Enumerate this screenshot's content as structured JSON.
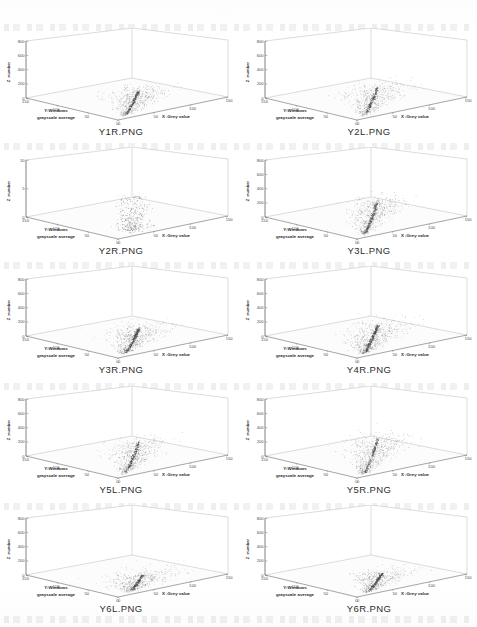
{
  "page": {
    "background_color": "#ffffff",
    "layout": "2 columns x 5 rows grid of 3D scatter plots",
    "columns": 2,
    "rows": 5
  },
  "axis_labels": {
    "x": "X :Grey value",
    "y_line1": "Y:Windows",
    "y_line2": "grayscale average",
    "z": "Z :number"
  },
  "chart_data": [
    {
      "type": "scatter",
      "title": "Y1R.PNG",
      "xlabel": "X :Grey value",
      "ylabel": "Y:Windows grayscale average",
      "zlabel": "Z :number",
      "xlim": [
        0,
        150
      ],
      "ylim": [
        0,
        150
      ],
      "zlim": [
        0,
        800
      ],
      "xticks": [
        0,
        50,
        100,
        150
      ],
      "yticks": [
        0,
        50,
        100,
        150
      ],
      "zticks": [
        0,
        200,
        400,
        600,
        800
      ],
      "grid": false,
      "point_color": "#555555",
      "cluster": "dense fan-shaped plume rising from origin toward mid grey values",
      "points_approx": 1800
    },
    {
      "type": "scatter",
      "title": "Y2L.PNG",
      "xlabel": "X :Grey value",
      "ylabel": "Y:Windows grayscale average",
      "zlabel": "Z :number",
      "xlim": [
        0,
        150
      ],
      "ylim": [
        0,
        150
      ],
      "zlim": [
        0,
        800
      ],
      "xticks": [
        0,
        50,
        100,
        150
      ],
      "yticks": [
        0,
        50,
        100,
        150
      ],
      "zticks": [
        0,
        200,
        400,
        600,
        800
      ],
      "grid": false,
      "point_color": "#555555",
      "cluster": "narrow vertical spine with broad fan spreading right",
      "points_approx": 1700
    },
    {
      "type": "scatter",
      "title": "Y2R.PNG",
      "xlabel": "X :Grey value",
      "ylabel": "Y:Windows grayscale average",
      "zlabel": "Z :number",
      "xlim": [
        0,
        150
      ],
      "ylim": [
        0,
        150
      ],
      "zlim": [
        0,
        10
      ],
      "xticks": [
        0,
        50,
        100,
        150
      ],
      "yticks": [
        0,
        50,
        100,
        150
      ],
      "zticks": [
        0,
        5,
        10
      ],
      "grid": false,
      "point_color": "#6a6a6a",
      "cluster": "diffuse low-amplitude speckle cloud near the floor",
      "points_approx": 900
    },
    {
      "type": "scatter",
      "title": "Y3L.PNG",
      "xlabel": "X :Grey value",
      "ylabel": "Y:Windows grayscale average",
      "zlabel": "Z :number",
      "xlim": [
        0,
        150
      ],
      "ylim": [
        0,
        150
      ],
      "zlim": [
        0,
        800
      ],
      "xticks": [
        0,
        50,
        100,
        150
      ],
      "yticks": [
        0,
        50,
        100,
        150
      ],
      "zticks": [
        0,
        200,
        400,
        600,
        800
      ],
      "grid": false,
      "point_color": "#555555",
      "cluster": "dense wedge of points fanning up and to the right",
      "points_approx": 1900
    },
    {
      "type": "scatter",
      "title": "Y3R.PNG",
      "xlabel": "X :Grey value",
      "ylabel": "Y:Windows grayscale average",
      "zlabel": "Z :number",
      "xlim": [
        0,
        150
      ],
      "ylim": [
        0,
        150
      ],
      "zlim": [
        0,
        800
      ],
      "xticks": [
        0,
        50,
        100,
        150
      ],
      "yticks": [
        0,
        50,
        100,
        150
      ],
      "zticks": [
        0,
        200,
        400,
        600,
        800
      ],
      "grid": false,
      "point_color": "#555555",
      "cluster": "wide plume leaning right with long tail",
      "points_approx": 2000
    },
    {
      "type": "scatter",
      "title": "Y4R.PNG",
      "xlabel": "X :Grey value",
      "ylabel": "Y:Windows grayscale average",
      "zlabel": "Z :number",
      "xlim": [
        0,
        150
      ],
      "ylim": [
        0,
        150
      ],
      "zlim": [
        0,
        800
      ],
      "xticks": [
        0,
        50,
        100,
        150
      ],
      "yticks": [
        0,
        50,
        100,
        150
      ],
      "zticks": [
        0,
        200,
        400,
        600,
        800
      ],
      "grid": false,
      "point_color": "#555555",
      "cluster": "compact dense plume with steep dark spine",
      "points_approx": 2100
    },
    {
      "type": "scatter",
      "title": "Y5L.PNG",
      "xlabel": "X :Grey value",
      "ylabel": "Y:Windows grayscale average",
      "zlabel": "Z :number",
      "xlim": [
        0,
        150
      ],
      "ylim": [
        0,
        150
      ],
      "zlim": [
        0,
        800
      ],
      "xticks": [
        0,
        50,
        100,
        150
      ],
      "yticks": [
        0,
        50,
        100,
        150
      ],
      "zticks": [
        0,
        200,
        400,
        600,
        800
      ],
      "grid": false,
      "point_color": "#555555",
      "cluster": "tall narrow spike with scattered base cloud",
      "points_approx": 1800
    },
    {
      "type": "scatter",
      "title": "Y5R.PNG",
      "xlabel": "X :Grey value",
      "ylabel": "Y:Windows grayscale average",
      "zlabel": "Z :number",
      "xlim": [
        0,
        150
      ],
      "ylim": [
        0,
        150
      ],
      "zlim": [
        0,
        800
      ],
      "xticks": [
        0,
        50,
        100,
        150
      ],
      "yticks": [
        0,
        50,
        100,
        150
      ],
      "zticks": [
        0,
        200,
        400,
        600,
        800
      ],
      "grid": false,
      "point_color": "#555555",
      "cluster": "steep spine with fan spreading up-right",
      "points_approx": 1900
    },
    {
      "type": "scatter",
      "title": "Y6L.PNG",
      "xlabel": "X :Grey value",
      "ylabel": "Y:Windows grayscale average",
      "zlabel": "Z :number",
      "xlim": [
        0,
        150
      ],
      "ylim": [
        0,
        150
      ],
      "zlim": [
        0,
        800
      ],
      "xticks": [
        0,
        50,
        100,
        150
      ],
      "yticks": [
        0,
        50,
        100,
        150
      ],
      "zticks": [
        0,
        200,
        400,
        600,
        800
      ],
      "grid": false,
      "point_color": "#555555",
      "cluster": "broad low flat cloud hugging the floor with a light ridge",
      "points_approx": 1600
    },
    {
      "type": "scatter",
      "title": "Y6R.PNG",
      "xlabel": "X :Grey value",
      "ylabel": "Y:Windows grayscale average",
      "zlabel": "Z :number",
      "xlim": [
        0,
        150
      ],
      "ylim": [
        0,
        150
      ],
      "zlim": [
        0,
        800
      ],
      "xticks": [
        0,
        50,
        100,
        150
      ],
      "yticks": [
        0,
        50,
        100,
        150
      ],
      "zticks": [
        0,
        200,
        400,
        600,
        800
      ],
      "grid": false,
      "point_color": "#555555",
      "cluster": "broad low cloud with faint rising ridge to the right",
      "points_approx": 1700
    }
  ]
}
